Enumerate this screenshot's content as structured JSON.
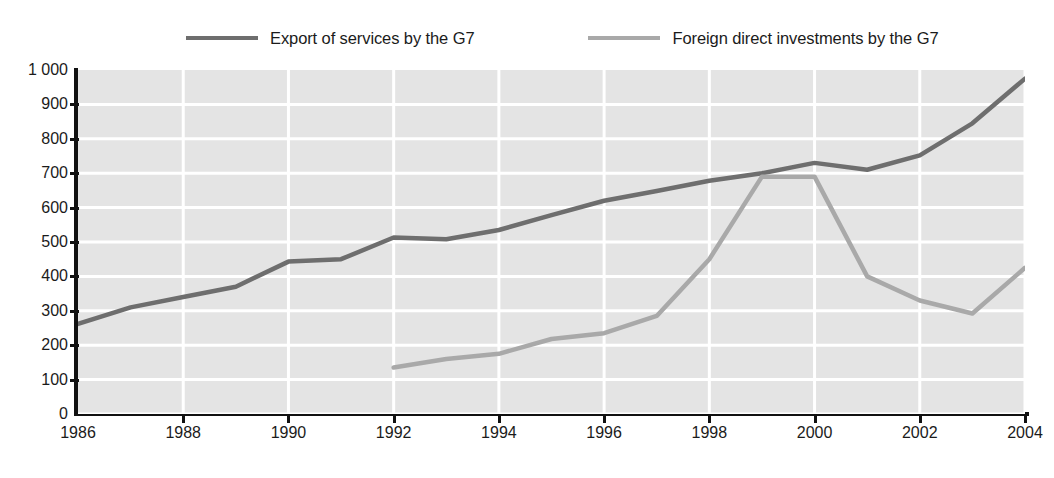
{
  "legend": {
    "position": "top",
    "entries": [
      {
        "label": "Export of services by the G7",
        "color": "#6e6e6e",
        "icon": "line-swatch-icon"
      },
      {
        "label": "Foreign direct investments by the G7",
        "color": "#a9a9a9",
        "icon": "line-swatch-icon"
      }
    ]
  },
  "axes": {
    "y_tick_labels": [
      "1 000",
      "900",
      "800",
      "700",
      "600",
      "500",
      "400",
      "300",
      "200",
      "100",
      "0"
    ],
    "x_tick_labels": [
      "1986",
      "1988",
      "1990",
      "1992",
      "1994",
      "1996",
      "1998",
      "2000",
      "2002",
      "2004"
    ]
  },
  "style": {
    "plot_background": "#e4e4e4",
    "gridline_color": "#ffffff",
    "axis_color": "#111111",
    "page_background": "#ffffff"
  },
  "chart_data": {
    "type": "line",
    "title": "",
    "subtitle": "",
    "xlabel": "",
    "ylabel": "",
    "xlim": [
      1986,
      2004
    ],
    "ylim": [
      0,
      1000
    ],
    "ytick_step": 100,
    "xtick_step": 2,
    "grid": true,
    "legend_position": "top",
    "x": [
      1986,
      1987,
      1988,
      1989,
      1990,
      1991,
      1992,
      1993,
      1994,
      1995,
      1996,
      1997,
      1998,
      1999,
      2000,
      2001,
      2002,
      2003,
      2004
    ],
    "series": [
      {
        "name": "Export of services by the G7",
        "color": "#6e6e6e",
        "x": [
          1986,
          1987,
          1988,
          1989,
          1990,
          1991,
          1992,
          1993,
          1994,
          1995,
          1996,
          1997,
          1998,
          1999,
          2000,
          2001,
          2002,
          2003,
          2004
        ],
        "values": [
          262,
          310,
          340,
          370,
          443,
          450,
          513,
          508,
          535,
          578,
          620,
          648,
          678,
          700,
          730,
          710,
          752,
          845,
          975
        ]
      },
      {
        "name": "Foreign direct investments by the G7",
        "color": "#a9a9a9",
        "x": [
          1992,
          1993,
          1994,
          1995,
          1996,
          1997,
          1998,
          1999,
          2000,
          2001,
          2002,
          2003,
          2004
        ],
        "values": [
          135,
          160,
          175,
          218,
          235,
          285,
          450,
          690,
          690,
          400,
          330,
          292,
          425
        ]
      }
    ]
  }
}
